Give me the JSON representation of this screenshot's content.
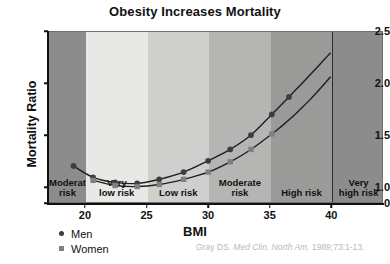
{
  "chart_data": {
    "type": "line",
    "title": "Obesity Increases Mortality",
    "xlabel": "BMI",
    "ylabel": "Mortality Ratio",
    "xlim": [
      17.0,
      44.2
    ],
    "ylim": [
      0.85,
      2.5
    ],
    "xticks": [
      20,
      25,
      30,
      35,
      40
    ],
    "yticks": [
      "0",
      "1.0",
      "1.5",
      "2.0",
      "2.5"
    ],
    "ytick_values": [
      0.85,
      1.0,
      1.5,
      2.0,
      2.5
    ],
    "grid": false,
    "axis_break": true,
    "legend_position": "below-left",
    "series": [
      {
        "name": "Men",
        "marker": "circle",
        "color": "#3d3d3d",
        "x": [
          19.0,
          20.6,
          22.4,
          24.2,
          26.0,
          28.0,
          30.0,
          31.8,
          33.5,
          35.2,
          36.6
        ],
        "y": [
          1.2,
          1.09,
          1.04,
          1.03,
          1.07,
          1.14,
          1.25,
          1.36,
          1.5,
          1.7,
          1.87
        ]
      },
      {
        "name": "Women",
        "marker": "square",
        "color": "#808080",
        "x": [
          20.6,
          22.4,
          24.2,
          26.0,
          28.0,
          30.0,
          31.8,
          33.5,
          35.2
        ],
        "y": [
          1.06,
          1.01,
          1.0,
          1.02,
          1.07,
          1.14,
          1.24,
          1.36,
          1.51
        ]
      }
    ],
    "risk_zones": [
      {
        "label": "Moderate\nrisk",
        "x_start": 17.0,
        "x_end": 20.0,
        "shade": "#8c8c8c"
      },
      {
        "label": "Very\nlow risk",
        "x_start": 20.0,
        "x_end": 25.0,
        "shade": "#e8e8e6"
      },
      {
        "label": "Low risk",
        "x_start": 25.0,
        "x_end": 30.0,
        "shade": "#cfcfcd"
      },
      {
        "label": "Moderate\nrisk",
        "x_start": 30.0,
        "x_end": 35.0,
        "shade": "#b5b5b3"
      },
      {
        "label": "High risk",
        "x_start": 35.0,
        "x_end": 40.0,
        "shade": "#9a9a98"
      },
      {
        "label": "Very\nhigh risk",
        "x_start": 40.0,
        "x_end": 44.2,
        "shade": "#8c8c8c"
      }
    ],
    "annotations": []
  },
  "legend": {
    "entries": [
      {
        "label": "Men",
        "marker": "circle-marker-icon"
      },
      {
        "label": "Women",
        "marker": "square-marker-icon"
      }
    ]
  },
  "citation": {
    "author": "Gray DS.",
    "journal": "Med Clin. North Am.",
    "reference": "1989;73:1-13."
  },
  "colors": {
    "plot_background": "#8c8c8c",
    "axis": "#111111",
    "men_series": "#3d3d3d",
    "women_series": "#808080",
    "citation_text": "#b9b9b9"
  }
}
